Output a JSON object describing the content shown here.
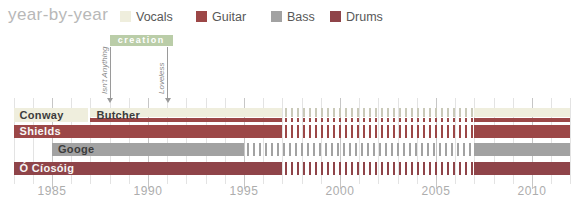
{
  "title": "year-by-year",
  "chart_data": {
    "type": "timeline",
    "title": "year-by-year",
    "legend": [
      {
        "label": "Vocals",
        "color": "#efeedd"
      },
      {
        "label": "Guitar",
        "color": "#9c4747"
      },
      {
        "label": "Bass",
        "color": "#a2a2a2"
      },
      {
        "label": "Drums",
        "color": "#8f4449"
      }
    ],
    "x_axis": {
      "start": 1983,
      "end": 2012,
      "tick_years": [
        1985,
        1990,
        1995,
        2000,
        2005,
        2010
      ],
      "tick_labels": [
        "1985",
        "1990",
        "1995",
        "2000",
        "2005",
        "2010"
      ]
    },
    "record_label_period": {
      "label": "creation",
      "start": 1988,
      "end": 1991.3,
      "color": "#bacda8",
      "text_color": "#ffffff"
    },
    "album_markers": [
      {
        "label": "Isn't Anything",
        "year": 1988
      },
      {
        "label": "Loveless",
        "year": 1991
      }
    ],
    "members": [
      {
        "name": "Conway",
        "row": 0,
        "roles": [
          "vocals"
        ],
        "segments": [
          {
            "start": 1983,
            "end": 1986.9,
            "style": "solid"
          }
        ]
      },
      {
        "name": "Butcher",
        "row": 0,
        "roles": [
          "vocals",
          "guitar"
        ],
        "segments": [
          {
            "start": 1987,
            "end": 1997,
            "style": "solid"
          },
          {
            "start": 1997,
            "end": 2007,
            "style": "dashed"
          },
          {
            "start": 2007,
            "end": 2012,
            "style": "solid"
          }
        ]
      },
      {
        "name": "Shields",
        "row": 1,
        "roles": [
          "guitar"
        ],
        "segments": [
          {
            "start": 1983,
            "end": 1997,
            "style": "solid"
          },
          {
            "start": 1997,
            "end": 2007,
            "style": "dashed"
          },
          {
            "start": 2007,
            "end": 2012,
            "style": "solid"
          }
        ]
      },
      {
        "name": "Googe",
        "row": 2,
        "roles": [
          "bass"
        ],
        "segments": [
          {
            "start": 1985,
            "end": 1995,
            "style": "solid"
          },
          {
            "start": 1995,
            "end": 2007,
            "style": "dashed"
          },
          {
            "start": 2007,
            "end": 2012,
            "style": "solid"
          }
        ]
      },
      {
        "name": "Ó Cíosóig",
        "row": 3,
        "roles": [
          "drums"
        ],
        "segments": [
          {
            "start": 1983,
            "end": 1997,
            "style": "solid"
          },
          {
            "start": 1997,
            "end": 2007,
            "style": "dashed"
          },
          {
            "start": 2007,
            "end": 2012,
            "style": "solid"
          }
        ]
      }
    ]
  }
}
